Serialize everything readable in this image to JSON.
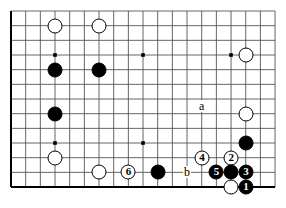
{
  "board": {
    "title": "go-board-diagram",
    "line_color": "#555555",
    "border_color": "#000000",
    "black_color": "#000000",
    "white_color": "#ffffff",
    "background": "#ffffff",
    "cols": 19,
    "rows": 13,
    "spacing": 14.67,
    "origin_x": 11,
    "origin_y": 11,
    "star_points": [
      {
        "col": 3,
        "row": 3
      },
      {
        "col": 9,
        "row": 3
      },
      {
        "col": 15,
        "row": 3
      },
      {
        "col": 3,
        "row": 9
      },
      {
        "col": 9,
        "row": 9
      }
    ],
    "stones": [
      {
        "id": "white-a1",
        "color": "white",
        "col": 3,
        "row": 1,
        "label": ""
      },
      {
        "id": "white-a2",
        "color": "white",
        "col": 6,
        "row": 1,
        "label": ""
      },
      {
        "id": "black-a1",
        "color": "black",
        "col": 3,
        "row": 4,
        "label": ""
      },
      {
        "id": "black-a2",
        "color": "black",
        "col": 6,
        "row": 4,
        "label": ""
      },
      {
        "id": "white-r1",
        "color": "white",
        "col": 16,
        "row": 3,
        "label": ""
      },
      {
        "id": "white-r2",
        "color": "white",
        "col": 16,
        "row": 7,
        "label": ""
      },
      {
        "id": "black-l1",
        "color": "black",
        "col": 3,
        "row": 7,
        "label": ""
      },
      {
        "id": "black-r1",
        "color": "black",
        "col": 16,
        "row": 9,
        "label": ""
      },
      {
        "id": "white-l2",
        "color": "white",
        "col": 3,
        "row": 10,
        "label": ""
      },
      {
        "id": "white-l3",
        "color": "white",
        "col": 6,
        "row": 11,
        "label": ""
      },
      {
        "id": "move-6",
        "color": "white",
        "col": 8,
        "row": 11,
        "label": "6"
      },
      {
        "id": "black-b1",
        "color": "black",
        "col": 10,
        "row": 11,
        "label": ""
      },
      {
        "id": "move-4",
        "color": "white",
        "col": 13,
        "row": 10,
        "label": "4"
      },
      {
        "id": "move-2",
        "color": "white",
        "col": 15,
        "row": 10,
        "label": "2"
      },
      {
        "id": "move-5",
        "color": "black",
        "col": 14,
        "row": 11,
        "label": "5"
      },
      {
        "id": "black-c1",
        "color": "black",
        "col": 15,
        "row": 11,
        "label": ""
      },
      {
        "id": "move-3",
        "color": "black",
        "col": 16,
        "row": 11,
        "label": "3"
      },
      {
        "id": "white-d1",
        "color": "white",
        "col": 15,
        "row": 12,
        "label": ""
      },
      {
        "id": "move-1",
        "color": "black",
        "col": 16,
        "row": 12,
        "label": "1"
      }
    ],
    "point_labels": [
      {
        "id": "point-a",
        "text": "a",
        "col": 13,
        "row": 6.5
      },
      {
        "id": "point-b",
        "text": "b",
        "col": 12,
        "row": 11
      }
    ]
  }
}
